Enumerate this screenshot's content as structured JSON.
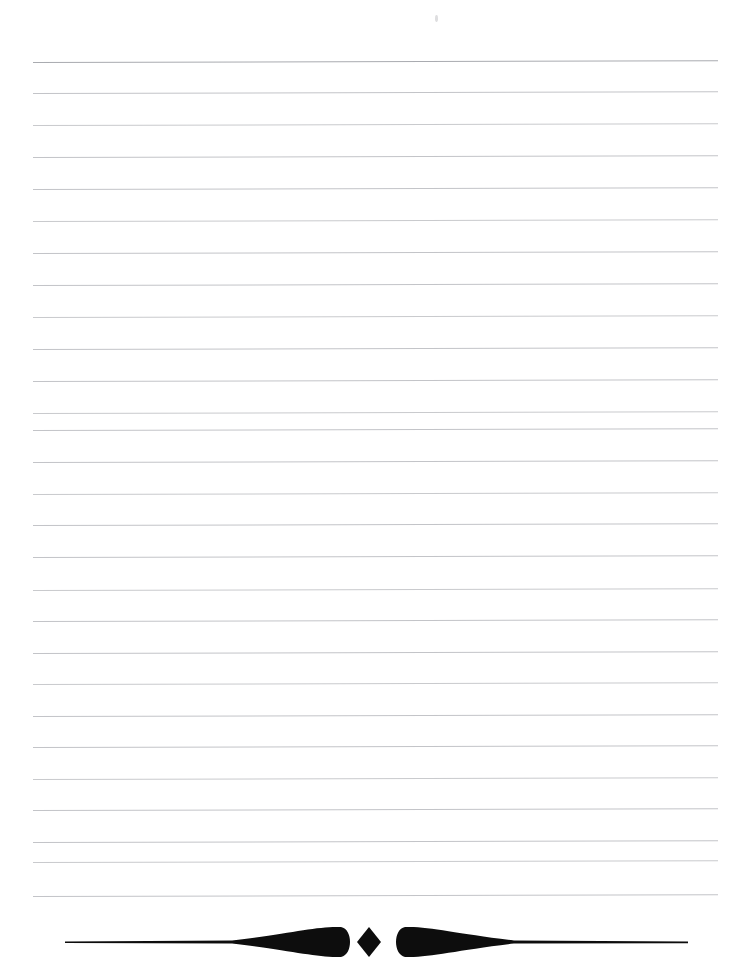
{
  "page": {
    "title": "Blank Lined Notepaper Page",
    "background_color": "#ffffff",
    "width": 747,
    "height": 978
  },
  "ruled_lines": {
    "name": "ruled-lines",
    "count": 27,
    "color": "#c3c4c8",
    "first_line_color": "#a9abb0",
    "left_x": 33,
    "right_x": 718,
    "first_y": 62,
    "spacing": 32.1,
    "thickness": 1,
    "y_positions": [
      62,
      93,
      125,
      157,
      189,
      221,
      253,
      285,
      317,
      349,
      381,
      413,
      430,
      462,
      494,
      525,
      557,
      590,
      621,
      653,
      684,
      716,
      747,
      779,
      810,
      842,
      862,
      896
    ],
    "slight_tilt_degrees": -0.15
  },
  "speck": {
    "name": "paper-speck",
    "x": 435,
    "y": 15,
    "color": "#d8d8db"
  },
  "ornament": {
    "name": "typographic-divider-ornament",
    "description": "Horizontal rule with two opposed teardrops flanking a center diamond",
    "color": "#0d0d0d",
    "center_x": 373,
    "center_y": 942,
    "left_rule_start_x": 65,
    "right_rule_end_x": 688,
    "left_teardrop": {
      "tip_x": 232,
      "bulb_x": 348,
      "max_half_height": 16
    },
    "right_teardrop": {
      "bulb_x": 398,
      "tip_x": 514,
      "max_half_height": 16
    },
    "diamond": {
      "left_x": 357,
      "right_x": 381,
      "half_height": 15
    },
    "rule_thickness": 3
  }
}
